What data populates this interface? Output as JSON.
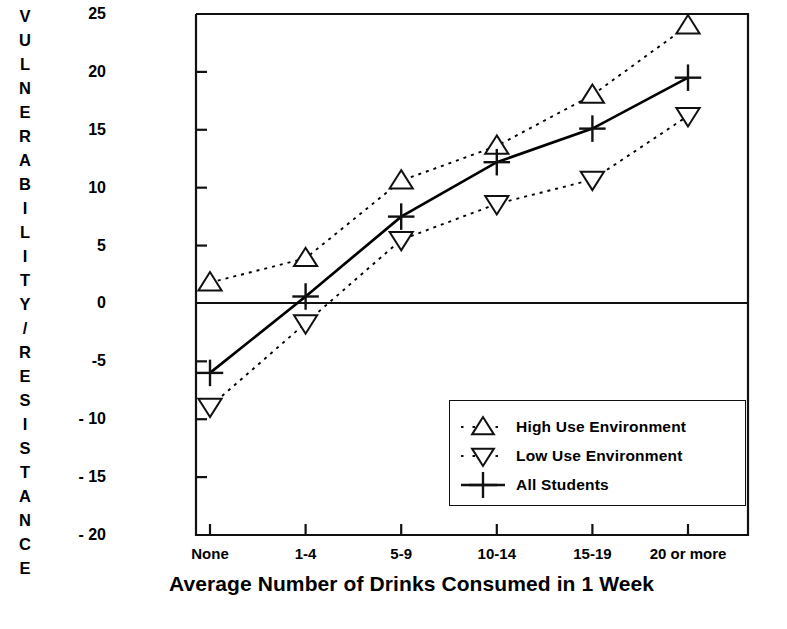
{
  "chart_data": {
    "type": "line",
    "title": "",
    "subtitle": "",
    "xlabel": "Average Number of Drinks Consumed in 1 Week",
    "ylabel": "VULNERABILITY/RESISTANCE",
    "categories": [
      "None",
      "1-4",
      "5-9",
      "10-14",
      "15-19",
      "20 or more"
    ],
    "ylim": [
      -20,
      25
    ],
    "yticks": [
      25,
      20,
      15,
      10,
      5,
      0,
      "-5",
      "- 10",
      "- 15",
      "- 20"
    ],
    "ytick_values": [
      25,
      20,
      15,
      10,
      5,
      0,
      -5,
      -10,
      -15,
      -20
    ],
    "grid": false,
    "zero_line": true,
    "legend_position": "lower-right-inside",
    "series": [
      {
        "name": "High Use Environment",
        "marker": "triangle-up",
        "linestyle": "dotted",
        "color": "#000000",
        "values": [
          1.8,
          3.9,
          10.6,
          13.6,
          18.0,
          24.0
        ]
      },
      {
        "name": "Low Use Environment",
        "marker": "triangle-down",
        "linestyle": "dotted",
        "color": "#000000",
        "values": [
          -8.9,
          -1.7,
          5.5,
          8.6,
          10.7,
          16.2
        ]
      },
      {
        "name": "All Students",
        "marker": "plus",
        "linestyle": "solid",
        "color": "#000000",
        "values": [
          -6.0,
          0.6,
          7.5,
          12.2,
          15.1,
          19.5
        ]
      }
    ]
  },
  "legend": {
    "items": [
      {
        "label": "High Use Environment",
        "symbol": "triangle-up-dotted"
      },
      {
        "label": "Low Use Environment",
        "symbol": "triangle-down-dotted"
      },
      {
        "label": "All Students",
        "symbol": "plus-solid"
      }
    ]
  },
  "colors": {
    "ink": "#111111",
    "background": "#ffffff"
  }
}
